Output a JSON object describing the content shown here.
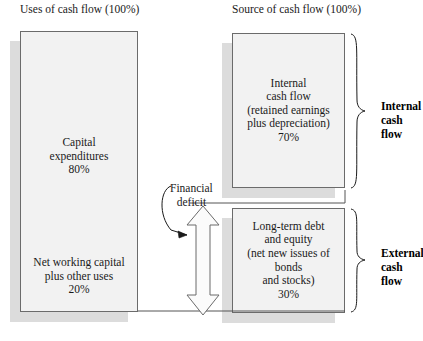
{
  "diagram": {
    "headers": {
      "left": "Uses of cash flow\n(100%)",
      "right": "Source of cash flow\n(100%)"
    },
    "left_column": {
      "box_name": "uses-of-cash-flow-box",
      "segments": [
        {
          "id": "capital-expenditures",
          "label": "Capital\nexpenditures\n80%",
          "percent": 80
        },
        {
          "id": "net-working-capital",
          "label": "Net working capital\nplus other uses\n20%",
          "percent": 20
        }
      ]
    },
    "right_column": {
      "boxes": [
        {
          "id": "internal-cash-flow",
          "label": "Internal\ncash flow\n(retained earnings\nplus depreciation)\n70%",
          "percent": 70,
          "brace_label": "Internal\ncash flow"
        },
        {
          "id": "external-cash-flow",
          "label": "Long-term debt\nand equity\n(net new issues of bonds\nand stocks)\n30%",
          "percent": 30,
          "brace_label": "External\ncash flow"
        }
      ]
    },
    "annotation": {
      "id": "financial-deficit",
      "label": "Financial\ndeficit"
    },
    "colors": {
      "box_fill": "#f2f2f2",
      "box_border": "#6b6b6b",
      "shadow": "#dcdcdc",
      "text": "#1a1a1a",
      "line": "#555555"
    }
  }
}
